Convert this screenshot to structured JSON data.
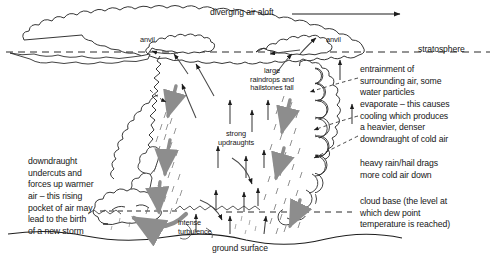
{
  "diagram": {
    "background_color": "#ffffff",
    "line_color": "#1c1c1c",
    "arrow_gray": "#8a8a8a",
    "labels": {
      "diverging_air_aloft": "diverging air aloft",
      "anvil_left": "anvil",
      "anvil_right": "anvil",
      "stratosphere": "stratosphere",
      "large_raindrops": "large\nraindrops and\nhailstones fall",
      "entrainment": "entrainment of\nsurrounding air, some\nwater particles\nevaporate – this causes\ncooling which produces\na heavier, denser\ndowndraught of cold air",
      "strong_updraughts": "strong\nupdraughts",
      "heavy_rain": "heavy rain/hail drags\nmore cold air down",
      "cloud_base": "cloud base (the level at\nwhich dew point\ntemperature is reached)",
      "downdraught": "downdraught\nundercuts and\nforces up warmer\nair – this rising\npocket of air may\nlead to the birth\nof a new storm",
      "intense_turbulence": "intense\nturbulence",
      "ground_surface": "ground surface"
    }
  }
}
